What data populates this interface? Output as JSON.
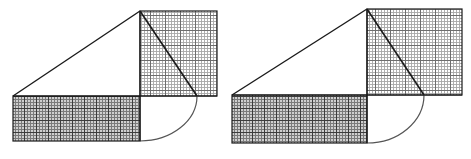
{
  "document": {
    "title": "Geometric construction diagram",
    "background_color": "#ffffff",
    "width": 471,
    "height": 159,
    "caption": ""
  },
  "palette": {
    "outline": "#1a1a1a",
    "arc": "#555555",
    "square_fill": "#ffffff",
    "square_grid_minor": "#a8a8a8",
    "square_grid_major": "#6e6e6e",
    "rect_fill": "#cfcfcf",
    "rect_grid_minor": "#7a7a7a",
    "rect_grid_major": "#3c3c3c"
  },
  "figures": [
    {
      "id": "figure-left",
      "label": "Left construction",
      "apex": {
        "x": 140,
        "y": 11
      },
      "left_vertex": {
        "x": 13,
        "y": 96
      },
      "baseline_y": 96,
      "square": {
        "name": "upper-right-square",
        "x": 140,
        "y": 11,
        "width": 77,
        "height": 85,
        "grid_minor_step": 3,
        "grid_major_step": 15,
        "shade": "light"
      },
      "rectangle": {
        "name": "lower-left-rectangle",
        "x": 13,
        "y": 96,
        "width": 127,
        "height": 45,
        "grid_minor_step": 3,
        "grid_major_step": 12,
        "shade": "dark"
      },
      "hypotenuse": {
        "x1": 13,
        "y1": 96,
        "x2": 140,
        "y2": 11
      },
      "diagonal": {
        "x1": 140,
        "y1": 11,
        "x2": 197,
        "y2": 96
      },
      "arc": {
        "start": {
          "x": 197,
          "y": 96
        },
        "end": {
          "x": 140,
          "y": 141
        },
        "radius_x": 57,
        "radius_y": 45,
        "sweep": 0
      }
    },
    {
      "id": "figure-right",
      "label": "Right construction",
      "apex": {
        "x": 367,
        "y": 9
      },
      "left_vertex": {
        "x": 232,
        "y": 95
      },
      "baseline_y": 95,
      "square": {
        "name": "upper-right-square",
        "x": 367,
        "y": 9,
        "width": 95,
        "height": 86,
        "grid_minor_step": 3,
        "grid_major_step": 15,
        "shade": "light"
      },
      "rectangle": {
        "name": "lower-left-rectangle",
        "x": 232,
        "y": 95,
        "width": 135,
        "height": 48,
        "grid_minor_step": 3,
        "grid_major_step": 12,
        "shade": "dark"
      },
      "hypotenuse": {
        "x1": 232,
        "y1": 95,
        "x2": 367,
        "y2": 9
      },
      "diagonal": {
        "x1": 367,
        "y1": 9,
        "x2": 424,
        "y2": 95
      },
      "arc": {
        "start": {
          "x": 424,
          "y": 95
        },
        "end": {
          "x": 367,
          "y": 143
        },
        "radius_x": 57,
        "radius_y": 48,
        "sweep": 0
      }
    }
  ]
}
